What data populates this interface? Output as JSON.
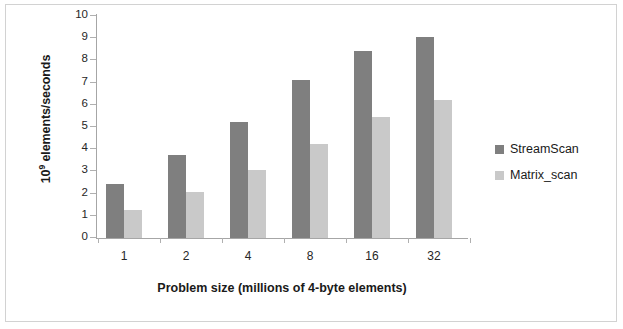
{
  "chart_data": {
    "type": "bar",
    "title": "",
    "categories": [
      "1",
      "2",
      "4",
      "8",
      "16",
      "32"
    ],
    "series": [
      {
        "name": "StreamScan",
        "color": "#7f7f7f",
        "values": [
          2.42,
          3.75,
          5.22,
          7.12,
          8.42,
          9.05
        ]
      },
      {
        "name": "Matrix_scan",
        "color": "#c9c9c9",
        "values": [
          1.27,
          2.07,
          3.07,
          4.23,
          5.45,
          6.22
        ]
      }
    ],
    "xlabel": "Problem size (millions of 4-byte elements)",
    "ylabel": "10⁹ elements/seconds",
    "ylabel_base": "10",
    "ylabel_exponent": "9",
    "ylabel_rest": " elements/seconds",
    "ylim": [
      0,
      10
    ],
    "ytick_labels": [
      "10",
      "9",
      "8",
      "7",
      "6",
      "5",
      "4",
      "3",
      "2",
      "1",
      "0"
    ],
    "ytick_values": [
      10,
      9,
      8,
      7,
      6,
      5,
      4,
      3,
      2,
      1,
      0
    ],
    "ytick_step": 1,
    "grid": false,
    "legend_position": "right"
  },
  "legend": {
    "items": [
      {
        "label": "StreamScan"
      },
      {
        "label": "Matrix_scan"
      }
    ]
  }
}
